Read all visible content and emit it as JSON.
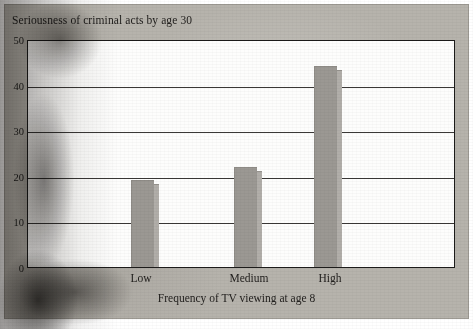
{
  "chart_data": {
    "type": "bar",
    "title": "Seriousness of criminal acts by age 30",
    "xlabel": "Frequency of TV viewing at age 8",
    "ylabel": "",
    "categories": [
      "Low",
      "Medium",
      "High"
    ],
    "values": [
      19,
      22,
      44
    ],
    "ylim": [
      0,
      50
    ],
    "yticks": [
      0,
      10,
      20,
      30,
      40,
      50
    ],
    "ytick_labels": [
      "0",
      "10",
      "20",
      "30",
      "40",
      "50"
    ],
    "grid": true,
    "legend": false,
    "legend_position": "none",
    "colors": {
      "bar_face": "#9b9893",
      "bar_side": "#b1aea9",
      "plot_background": "#fdfdfc",
      "figure_background": "#b6b3ac",
      "axis": "#1c1b1a",
      "gridline": "#3a3836",
      "text": "#23211f"
    }
  }
}
